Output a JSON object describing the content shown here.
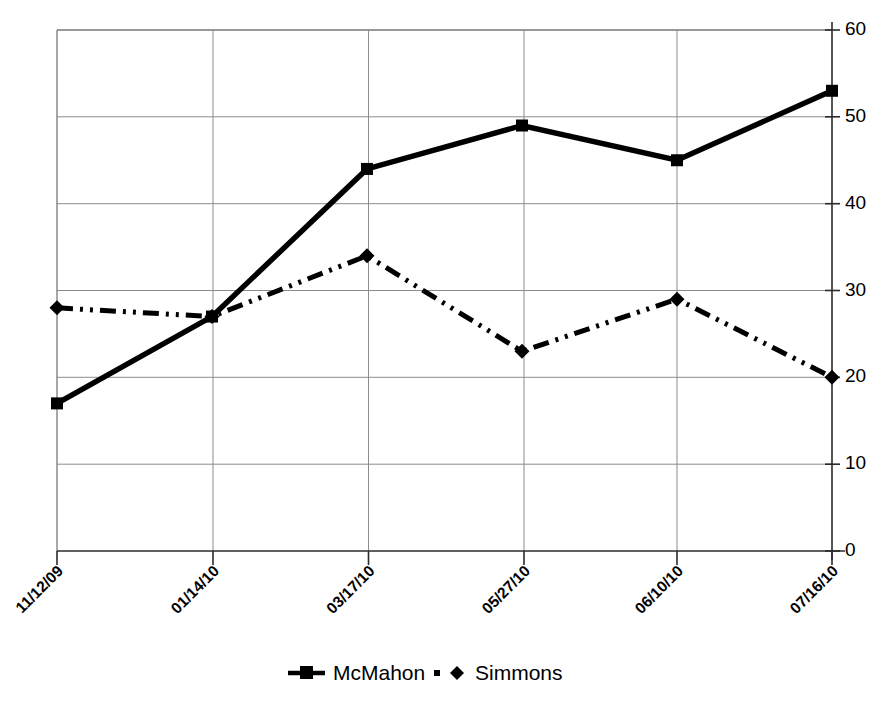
{
  "chart_data": {
    "type": "line",
    "title": "",
    "subtitle": "",
    "xlabel": "",
    "ylabel": "",
    "categories": [
      "11/12/09",
      "01/14/10",
      "03/17/10",
      "05/27/10",
      "06/10/10",
      "07/16/10"
    ],
    "series": [
      {
        "name": "McMahon",
        "values": [
          17,
          27,
          44,
          49,
          45,
          53
        ],
        "line_style": "solid",
        "marker": "square",
        "color": "#000000"
      },
      {
        "name": "Simmons",
        "values": [
          28,
          27,
          34,
          23,
          29,
          20
        ],
        "line_style": "dash-dot-dot",
        "marker": "diamond",
        "color": "#000000"
      }
    ],
    "ylim": [
      0,
      60
    ],
    "y_ticks": [
      0,
      10,
      20,
      30,
      40,
      50,
      60
    ],
    "y_tick_labels": [
      "0",
      "10",
      "20",
      "30",
      "40",
      "50",
      "60"
    ],
    "y_axis_position": "right",
    "grid": true,
    "grid_axis": "y",
    "legend_position": "bottom",
    "x_tick_label_rotation": 45,
    "colors": {
      "line": "#000000",
      "grid": "#8c8c8c",
      "axis": "#2b2b2b",
      "background": "#ffffff"
    }
  },
  "legend": {
    "items": [
      {
        "label": "McMahon",
        "marker": "square-marker",
        "style": "solid"
      },
      {
        "label": "Simmons",
        "marker": "diamond-marker",
        "style": "dash-dot-dot"
      }
    ]
  },
  "y_axis": {
    "labels": [
      "60",
      "50",
      "40",
      "30",
      "20",
      "10",
      "0"
    ]
  },
  "x_axis": {
    "labels": [
      "11/12/09",
      "01/14/10",
      "03/17/10",
      "05/27/10",
      "06/10/10",
      "07/16/10"
    ]
  }
}
